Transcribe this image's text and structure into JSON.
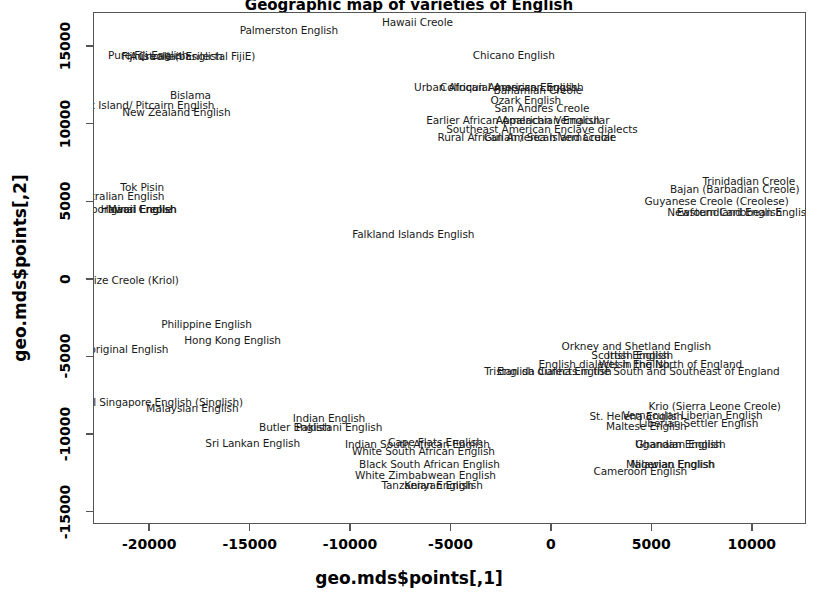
{
  "chart_data": {
    "type": "scatter",
    "title": "Geographic map of varieties of English",
    "xlabel": "geo.mds$points[,1]",
    "ylabel": "geo.mds$points[,2]",
    "xlim": [
      -22800,
      12700
    ],
    "ylim": [
      -15800,
      17200
    ],
    "xticks": [
      -20000,
      -15000,
      -10000,
      -5000,
      0,
      5000,
      10000
    ],
    "yticks": [
      -15000,
      -10000,
      -5000,
      0,
      5000,
      10000,
      15000
    ],
    "xticklabels": [
      "-20000",
      "-15000",
      "-10000",
      "-5000",
      "0",
      "5000",
      "10000"
    ],
    "yticklabels": [
      "-15000",
      "-10000",
      "-5000",
      "0",
      "5000",
      "10000",
      "15000"
    ],
    "grid": false,
    "legend": false,
    "marker": "text-label",
    "points": [
      {
        "label": "Palmerston English",
        "x": -13100,
        "y": 16100
      },
      {
        "label": "Hawaii Creole",
        "x": -6700,
        "y": 16600
      },
      {
        "label": "Pure Fiji English",
        "x": -20100,
        "y": 14500
      },
      {
        "label": "Australian English",
        "x": -18700,
        "y": 14450
      },
      {
        "label": "Fiji Creole (basilectal FijiE)",
        "x": -18100,
        "y": 14400
      },
      {
        "label": "Chicano English",
        "x": -1900,
        "y": 14500
      },
      {
        "label": "Bislama",
        "x": -18000,
        "y": 11900
      },
      {
        "label": "Urban African American English",
        "x": -2800,
        "y": 12400
      },
      {
        "label": "Colloquial American English",
        "x": -2000,
        "y": 12400
      },
      {
        "label": "Norfolk Island/ Pitcairn English",
        "x": -20700,
        "y": 11250
      },
      {
        "label": "New Zealand English",
        "x": -18700,
        "y": 10800
      },
      {
        "label": "Ozark English",
        "x": -1300,
        "y": 11600
      },
      {
        "label": "Bahamian Creole",
        "x": -700,
        "y": 12250
      },
      {
        "label": "San Andres Creole",
        "x": -500,
        "y": 11100
      },
      {
        "label": "Earlier African American Vernacular",
        "x": -1700,
        "y": 10300
      },
      {
        "label": "Appalachian English",
        "x": -200,
        "y": 10300
      },
      {
        "label": "Southeast American Enclave dialects",
        "x": -500,
        "y": 9700
      },
      {
        "label": "Rural African American Vernacular",
        "x": -1300,
        "y": 9200
      },
      {
        "label": "Gullah / Sea Island Creole",
        "x": -100,
        "y": 9200
      },
      {
        "label": "Trinidadian Creole",
        "x": 9800,
        "y": 6350
      },
      {
        "label": "Tok Pisin",
        "x": -20400,
        "y": 6000
      },
      {
        "label": "Bajan (Barbadian Creole)",
        "x": 9100,
        "y": 5850
      },
      {
        "label": "Australian English",
        "x": -21600,
        "y": 5400
      },
      {
        "label": "Guyanese Creole (Creolese)",
        "x": 8200,
        "y": 5100
      },
      {
        "label": "Aboriginal English",
        "x": -21000,
        "y": 4550
      },
      {
        "label": "Maori English",
        "x": -20400,
        "y": 4550
      },
      {
        "label": "Hawaii Creole",
        "x": -20700,
        "y": 4550
      },
      {
        "label": "Newfoundland English",
        "x": 8600,
        "y": 4350
      },
      {
        "label": "Eastern Caribbean English",
        "x": 9600,
        "y": 4350
      },
      {
        "label": "Falkland Islands English",
        "x": -6900,
        "y": 2950
      },
      {
        "label": "Belize Creole (Kriol)",
        "x": -21100,
        "y": 0
      },
      {
        "label": "Philippine English",
        "x": -17200,
        "y": -2850
      },
      {
        "label": "Hong Kong English",
        "x": -15900,
        "y": -3900
      },
      {
        "label": "Aboriginal English",
        "x": -21400,
        "y": -4450
      },
      {
        "label": "Orkney and Shetland English",
        "x": 4200,
        "y": -4250
      },
      {
        "label": "Scottish English",
        "x": 4000,
        "y": -4850
      },
      {
        "label": "Irish English",
        "x": 4300,
        "y": -4850
      },
      {
        "label": "English dialects in the North of England",
        "x": 4400,
        "y": -5400
      },
      {
        "label": "Welsh English",
        "x": 4100,
        "y": -5400
      },
      {
        "label": "Tristan da Cunha English",
        "x": -200,
        "y": -5900
      },
      {
        "label": "English dialects in the South and Southeast of England",
        "x": 4300,
        "y": -5900
      },
      {
        "label": "Colloquial Singapore English (Singlish)",
        "x": -20300,
        "y": -7900
      },
      {
        "label": "Malaysian English",
        "x": -17900,
        "y": -8250
      },
      {
        "label": "Krio (Sierra Leone Creole)",
        "x": 8100,
        "y": -8100
      },
      {
        "label": "Indian English",
        "x": -11100,
        "y": -8900
      },
      {
        "label": "Vernacular Liberian English",
        "x": 7000,
        "y": -8700
      },
      {
        "label": "St. Helena English",
        "x": 4200,
        "y": -8800
      },
      {
        "label": "Liberian Settler English",
        "x": 7300,
        "y": -9200
      },
      {
        "label": "Butler English",
        "x": -12800,
        "y": -9500
      },
      {
        "label": "Pakistani English",
        "x": -10600,
        "y": -9500
      },
      {
        "label": "Maltese English",
        "x": 4700,
        "y": -9400
      },
      {
        "label": "Cape Flats English",
        "x": -5800,
        "y": -10450
      },
      {
        "label": "Indian South African English",
        "x": -6700,
        "y": -10550
      },
      {
        "label": "Sri Lankan English",
        "x": -14900,
        "y": -10500
      },
      {
        "label": "White South African English",
        "x": -6400,
        "y": -11000
      },
      {
        "label": "Ghanaian English",
        "x": 6400,
        "y": -10550
      },
      {
        "label": "Ugandan English",
        "x": 6300,
        "y": -10550
      },
      {
        "label": "Black South African English",
        "x": -6100,
        "y": -11900
      },
      {
        "label": "Nigerian English",
        "x": 6000,
        "y": -11900
      },
      {
        "label": "Malawian English",
        "x": 5900,
        "y": -11900
      },
      {
        "label": "White Zimbabwean English",
        "x": -6300,
        "y": -12600
      },
      {
        "label": "Cameroon English",
        "x": 4400,
        "y": -12350
      },
      {
        "label": "Kenyan English",
        "x": -5400,
        "y": -13200
      },
      {
        "label": "Tanzanian English",
        "x": -6200,
        "y": -13200
      }
    ]
  }
}
